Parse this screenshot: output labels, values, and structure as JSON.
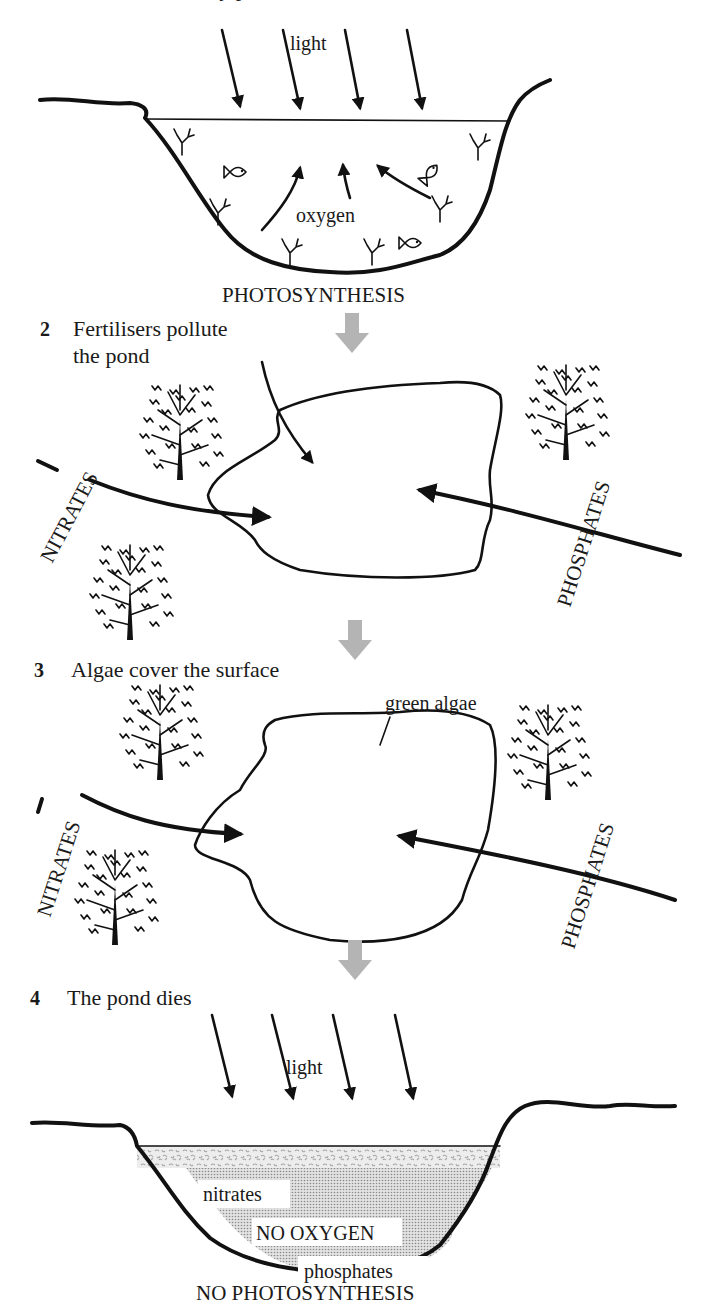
{
  "title_clipped": "1 A healthy pond",
  "colors": {
    "ink": "#111111",
    "grey_arrow": "#b4b4b4",
    "algae": "#b8b8b8",
    "dead_water": "#cfcfcf",
    "background": "#ffffff"
  },
  "sections": [
    {
      "number": "1",
      "title": "A healthy pond",
      "labels": {
        "light": "light",
        "oxygen": "oxygen",
        "caption": "PHOTOSYNTHESIS"
      }
    },
    {
      "number": "2",
      "title_line1": "Fertilisers pollute",
      "title_line2": "the pond",
      "labels": {
        "left_input": "NITRATES",
        "right_input": "PHOSPHATES"
      }
    },
    {
      "number": "3",
      "title": "Algae cover the surface",
      "labels": {
        "algae": "green algae",
        "left_input": "NITRATES",
        "right_input": "PHOSPHATES"
      }
    },
    {
      "number": "4",
      "title": "The pond dies",
      "labels": {
        "light": "light",
        "nitrates": "nitrates",
        "no_oxygen": "NO OXYGEN",
        "phosphates": "phosphates",
        "caption": "NO PHOTOSYNTHESIS"
      }
    }
  ]
}
